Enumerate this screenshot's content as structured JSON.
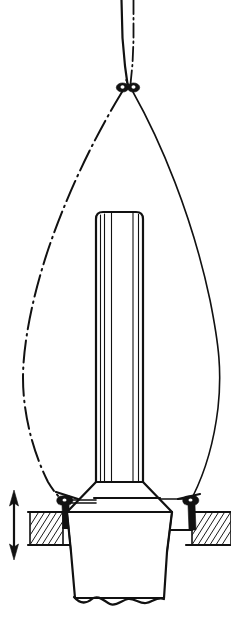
{
  "figure": {
    "background_color": "#ffffff",
    "line_color": "#111111",
    "width": 231,
    "height": 619
  },
  "elements": {
    "upper_lines": {
      "solid_label": "standing halyard (solid)",
      "phantom_label": "alternate halyard position (dash-dot)"
    },
    "apex_fitting": {
      "label": "shackle pair at masthead crane",
      "count": 2
    },
    "left_cable": {
      "label": "guy line, alternate position",
      "style": "dash-dot"
    },
    "right_cable": {
      "label": "guy line, rigged position",
      "style": "solid"
    },
    "mast": {
      "label": "mast column with flutes",
      "flute_count": 7
    },
    "mast_base": {
      "label": "mast heel / tabernacle flare"
    },
    "left_bracket": {
      "label": "port deck chainplate fitting"
    },
    "right_bracket": {
      "label": "starboard deck chainplate fitting"
    },
    "left_deck": {
      "label": "port deck section (hatched)",
      "hatch": "45 degree section hatch"
    },
    "right_deck": {
      "label": "starboard deck section (hatched)",
      "hatch": "45 degree section hatch"
    },
    "travel_arrow": {
      "label": "vertical travel dimension",
      "style": "double-headed arrow"
    },
    "lower_body": {
      "label": "hull section below deck",
      "bottom_edge": "break line"
    },
    "center_datum": {
      "label": "horizontal datum line"
    }
  }
}
